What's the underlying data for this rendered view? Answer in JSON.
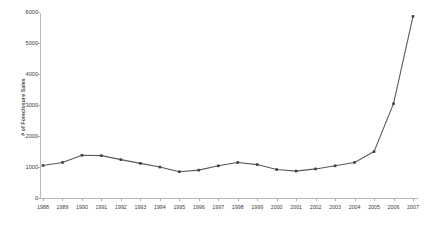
{
  "chart_data": {
    "type": "line",
    "title": "",
    "xlabel": "",
    "ylabel": "# of Foreclosure Sales",
    "categories": [
      "1988",
      "1989",
      "1990",
      "1991",
      "1992",
      "1993",
      "1994",
      "1995",
      "1996",
      "1997",
      "1998",
      "1999",
      "2000",
      "2001",
      "2002",
      "2003",
      "2004",
      "2005",
      "2006",
      "2007"
    ],
    "values": [
      1050,
      1150,
      1380,
      1370,
      1240,
      1120,
      1000,
      850,
      900,
      1040,
      1150,
      1080,
      920,
      870,
      940,
      1040,
      1150,
      1500,
      3050,
      5870
    ],
    "series": [
      {
        "name": "# of Foreclosure Sales",
        "values": [
          1050,
          1150,
          1380,
          1370,
          1240,
          1120,
          1000,
          850,
          900,
          1040,
          1150,
          1080,
          920,
          870,
          940,
          1040,
          1150,
          1500,
          3050,
          5870
        ]
      }
    ],
    "ylim": [
      0,
      6000
    ],
    "yticks": [
      0,
      1000,
      2000,
      3000,
      4000,
      5000,
      6000
    ],
    "ytick_labels": [
      "0",
      "1000",
      "2000",
      "3000",
      "4000",
      "5000",
      "6000"
    ],
    "grid": false,
    "legend": false,
    "legend_position": "none",
    "line_color": "#595959",
    "marker_color": "#404040",
    "axis_color": "#b9b9b9",
    "background": "#ffffff"
  },
  "axis": {
    "y_title": "# of Foreclosure Sales"
  }
}
